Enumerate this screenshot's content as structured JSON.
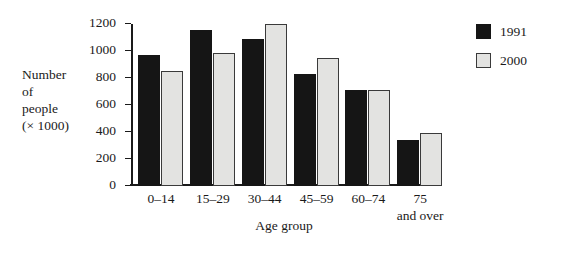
{
  "chart_data": {
    "type": "bar",
    "title": "",
    "xlabel": "Age group",
    "ylabel": "Number\nof\npeople\n(× 1000)",
    "categories": [
      "0–14",
      "15–29",
      "30–44",
      "45–59",
      "60–74",
      "75\nand over"
    ],
    "series": [
      {
        "name": "1991",
        "color": "#151515",
        "values": [
          970,
          1155,
          1090,
          830,
          710,
          340
        ]
      },
      {
        "name": "2000",
        "color": "#e3e3e1",
        "values": [
          855,
          985,
          1200,
          945,
          710,
          395
        ]
      }
    ],
    "ylim": [
      0,
      1200
    ],
    "yticks": [
      0,
      200,
      400,
      600,
      800,
      1000,
      1200
    ],
    "ytick_labels": [
      "0",
      "200",
      "400",
      "600",
      "800",
      "1000",
      "1200"
    ],
    "grid": false,
    "legend_position": "right"
  },
  "legend": {
    "entries": [
      {
        "label": "1991"
      },
      {
        "label": "2000"
      }
    ]
  }
}
